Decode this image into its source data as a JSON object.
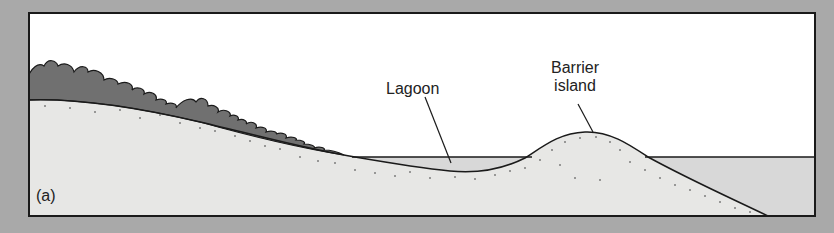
{
  "diagram": {
    "panel_label": "(a)",
    "labels": {
      "lagoon": "Lagoon",
      "barrier_line1": "Barrier",
      "barrier_line2": "island"
    },
    "elements": [
      "vegetated mainland slope",
      "lagoon",
      "barrier island",
      "ocean"
    ],
    "colors": {
      "background": "#a9a9a9",
      "sky": "#ffffff",
      "sediment": "#e6e6e4",
      "water": "#d6d6d6",
      "vegetation": "#6e6e6e",
      "outline": "#1a1a1a"
    }
  }
}
